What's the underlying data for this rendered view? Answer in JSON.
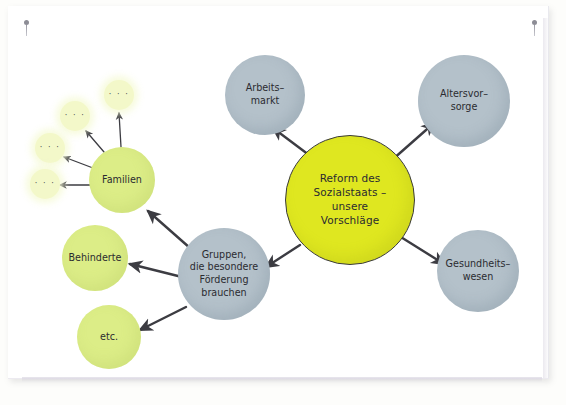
{
  "canvas": {
    "title": "Mindmap Reform des Sozialstaats",
    "background_color": "#ffffff",
    "paper_color": "#ffffff"
  },
  "colors": {
    "center_fill": "#dfe720",
    "center_stroke": "#3a3a3c",
    "grey_fill": "#b4c1ca",
    "green_fill": "#dced87",
    "dots_fill": "#f3f8c9",
    "arrow": "#3c3c42",
    "text": "#2b2b30"
  },
  "pins": [
    {
      "name": "pin-top-left",
      "x": 24,
      "y": 20
    },
    {
      "name": "pin-top-right",
      "x": 532,
      "y": 20
    }
  ],
  "nodes": {
    "center": {
      "id": "reform-des-sozialstaats",
      "lines": [
        "Reform des",
        "Sozialstaats –",
        "unsere",
        "Vorschläge"
      ],
      "text": "Reform des Sozialstaats – unsere Vorschläge",
      "cx": 349,
      "cy": 199,
      "r": 64,
      "fill": "#dfe720",
      "kind": "center"
    },
    "branches": [
      {
        "id": "arbeitsmarkt",
        "lines": [
          "Arbeits–",
          "markt"
        ],
        "text": "Arbeits–markt",
        "cx": 265,
        "cy": 95,
        "r": 40,
        "fill": "#b4c1ca",
        "kind": "grey"
      },
      {
        "id": "altersvorsorge",
        "lines": [
          "Altersvor–",
          "sorge"
        ],
        "text": "Altersvor–sorge",
        "cx": 464,
        "cy": 101,
        "r": 46,
        "fill": "#b4c1ca",
        "kind": "grey"
      },
      {
        "id": "gesundheitswesen",
        "lines": [
          "Gesundheits–",
          "wesen"
        ],
        "text": "Gesundheits–wesen",
        "cx": 478,
        "cy": 271,
        "r": 41,
        "fill": "#b4c1ca",
        "kind": "grey"
      },
      {
        "id": "gruppen-besondere-foerderung",
        "lines": [
          "Gruppen,",
          "die besondere",
          "Förderung",
          "brauchen"
        ],
        "text": "Gruppen, die besondere Förderung brauchen",
        "cx": 224,
        "cy": 274,
        "r": 46,
        "fill": "#b4c1ca",
        "kind": "grey"
      },
      {
        "id": "familien",
        "lines": [
          "Familien"
        ],
        "text": "Familien",
        "cx": 122,
        "cy": 180,
        "r": 33,
        "fill": "#dced87",
        "kind": "green"
      },
      {
        "id": "behinderte",
        "lines": [
          "Behinderte"
        ],
        "text": "Behinderte",
        "cx": 95,
        "cy": 258,
        "r": 33,
        "fill": "#dced87",
        "kind": "green"
      },
      {
        "id": "etc",
        "lines": [
          "etc."
        ],
        "text": "etc.",
        "cx": 109,
        "cy": 337,
        "r": 32,
        "fill": "#dced87",
        "kind": "green"
      }
    ],
    "dots": [
      {
        "id": "dots-1",
        "text": "· · ·",
        "cx": 119,
        "cy": 95,
        "r": 15
      },
      {
        "id": "dots-2",
        "text": "· · ·",
        "cx": 75,
        "cy": 116,
        "r": 15
      },
      {
        "id": "dots-3",
        "text": "· · ·",
        "cx": 50,
        "cy": 148,
        "r": 15
      },
      {
        "id": "dots-4",
        "text": "· · ·",
        "cx": 45,
        "cy": 184,
        "r": 15
      }
    ]
  },
  "arrows": [
    {
      "id": "center-to-arbeitsmarkt",
      "from": "center",
      "to": "arbeitsmarkt",
      "x1": 309,
      "y1": 155,
      "x2": 273,
      "y2": 128
    },
    {
      "id": "center-to-altersvorsorge",
      "from": "center",
      "to": "altersvorsorge",
      "x1": 392,
      "y1": 160,
      "x2": 434,
      "y2": 123
    },
    {
      "id": "center-to-gesundheitswesen",
      "from": "center",
      "to": "gesundheitswesen",
      "x1": 396,
      "y1": 234,
      "x2": 444,
      "y2": 264
    },
    {
      "id": "center-to-gruppen",
      "from": "center",
      "to": "gruppen",
      "x1": 300,
      "y1": 245,
      "x2": 266,
      "y2": 267
    },
    {
      "id": "gruppen-to-familien",
      "from": "gruppen",
      "to": "familien",
      "x1": 190,
      "y1": 248,
      "x2": 148,
      "y2": 211
    },
    {
      "id": "gruppen-to-behinderte",
      "from": "gruppen",
      "to": "behinderte",
      "x1": 182,
      "y1": 277,
      "x2": 130,
      "y2": 264
    },
    {
      "id": "gruppen-to-etc",
      "from": "gruppen",
      "to": "etc",
      "x1": 186,
      "y1": 307,
      "x2": 140,
      "y2": 330
    },
    {
      "id": "familien-to-dots-1",
      "from": "familien",
      "to": "dots-1",
      "x1": 121,
      "y1": 147,
      "x2": 119,
      "y2": 113
    },
    {
      "id": "familien-to-dots-2",
      "from": "familien",
      "to": "dots-2",
      "x1": 104,
      "y1": 152,
      "x2": 86,
      "y2": 131
    },
    {
      "id": "familien-to-dots-3",
      "from": "familien",
      "to": "dots-3",
      "x1": 93,
      "y1": 168,
      "x2": 64,
      "y2": 157
    },
    {
      "id": "familien-to-dots-4",
      "from": "familien",
      "to": "dots-4",
      "x1": 90,
      "y1": 185,
      "x2": 60,
      "y2": 185
    }
  ]
}
